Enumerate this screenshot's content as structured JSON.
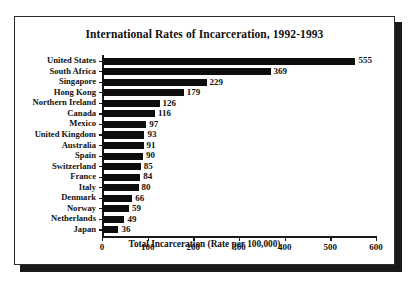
{
  "chart_data": {
    "type": "bar",
    "orientation": "horizontal",
    "title": "International Rates of Incarceration, 1992-1993",
    "xlabel": "Total Incarceration (Rate per 100,000)",
    "ylabel": "",
    "xlim": [
      0,
      600
    ],
    "xticks": [
      0,
      100,
      200,
      300,
      400,
      500,
      600
    ],
    "xtick_labels": [
      "0",
      "100",
      "200",
      "300",
      "400",
      "500",
      "600"
    ],
    "grid": false,
    "legend": null,
    "bar_color": "#0d0d0d",
    "categories": [
      "United States",
      "South Africa",
      "Singapore",
      "Hong Kong",
      "Northern Ireland",
      "Canada",
      "Mexico",
      "United Kingdom",
      "Australia",
      "Spain",
      "Switzerland",
      "France",
      "Italy",
      "Denmark",
      "Norway",
      "Netherlands",
      "Japan"
    ],
    "values": [
      555,
      369,
      229,
      179,
      126,
      116,
      97,
      93,
      91,
      90,
      85,
      84,
      80,
      66,
      59,
      49,
      36
    ],
    "value_labels": [
      "555",
      "369",
      "229",
      "179",
      "126",
      "116",
      "97",
      "93",
      "91",
      "90",
      "85",
      "84",
      "80",
      "66",
      "59",
      "49",
      "36"
    ]
  }
}
